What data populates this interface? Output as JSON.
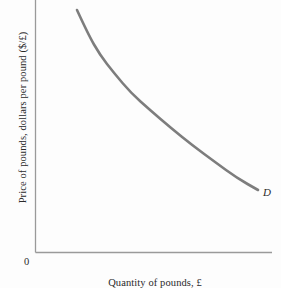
{
  "figure": {
    "background_color": "#fdfdfd",
    "origin_label": "0",
    "axis_color": "#9a9a9a",
    "text_color": "#2a2a2a"
  },
  "chart_data": {
    "type": "line",
    "title": "",
    "subtitle": "",
    "xlabel": "Quantity of pounds, £",
    "ylabel": "Price of pounds, dollars per pound ($/£)",
    "grid": false,
    "legend_position": "inline-right-end",
    "origin_label": "0",
    "xlim": [
      0,
      100
    ],
    "ylim": [
      0,
      100
    ],
    "axis_ticks": {
      "x": [],
      "y": []
    },
    "series": [
      {
        "name": "D",
        "label": "D",
        "label_text": "D",
        "color": "#7d7d7d",
        "line_width": 2.6,
        "shape": "convex-decreasing",
        "description": "Downward-sloping demand curve for pounds, convex to the origin",
        "x": [
          17,
          22,
          28,
          35,
          43,
          52,
          62,
          72,
          83,
          92
        ],
        "y": [
          96,
          86,
          76,
          67,
          58,
          50,
          43,
          37,
          32,
          28
        ],
        "points_px": [
          [
            77,
            10
          ],
          [
            88,
            34
          ],
          [
            100,
            55
          ],
          [
            114,
            73
          ],
          [
            131,
            93
          ],
          [
            150,
            110
          ],
          [
            171,
            128
          ],
          [
            192,
            145
          ],
          [
            215,
            162
          ],
          [
            237,
            178
          ],
          [
            258,
            190
          ]
        ]
      }
    ],
    "annotations": [
      {
        "name": "demand-curve-label",
        "text": "D",
        "italic": true,
        "position_px": [
          263,
          186
        ]
      },
      {
        "name": "origin",
        "text": "0",
        "italic": false,
        "position_px": [
          24,
          256
        ]
      }
    ]
  }
}
